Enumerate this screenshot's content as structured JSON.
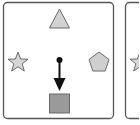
{
  "diagram": {
    "colors": {
      "border": "#555555",
      "background": "#ffffff",
      "shape_fill": "#cfcfcf",
      "shape_stroke": "#6a6a6a",
      "square_fill": "#9a9a9a",
      "arrow": "#111111"
    },
    "panels": [
      {
        "id": "panel-1",
        "shapes": [
          {
            "type": "triangle",
            "position": "top"
          },
          {
            "type": "star",
            "position": "left"
          },
          {
            "type": "pentagon",
            "position": "right"
          },
          {
            "type": "square",
            "position": "bottom"
          }
        ],
        "agent": {
          "type": "dot-with-arrow",
          "direction": "down"
        }
      },
      {
        "id": "panel-2",
        "partial": true,
        "shapes": [
          {
            "type": "star",
            "position": "left"
          }
        ]
      }
    ]
  }
}
